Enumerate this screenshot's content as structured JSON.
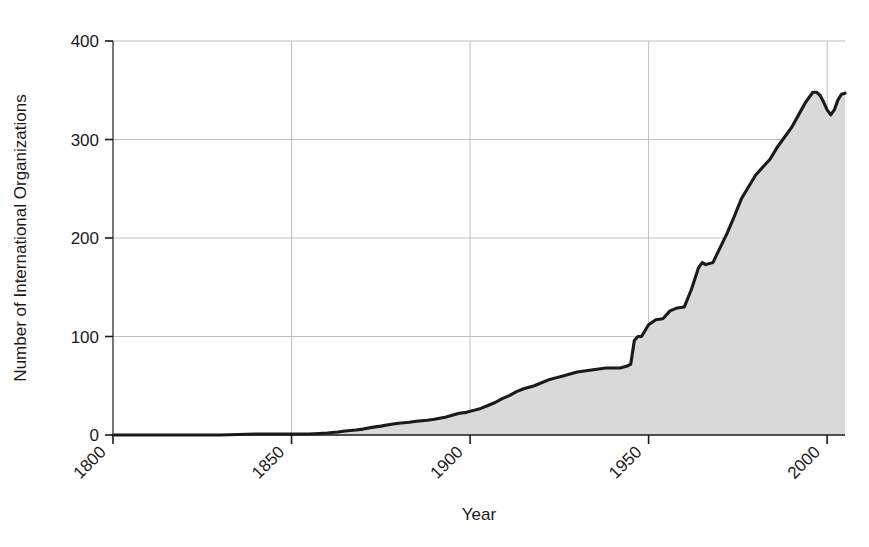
{
  "chart_data": {
    "type": "area",
    "title": "",
    "xlabel": "Year",
    "ylabel": "Number of International Organizations",
    "xlim": [
      1800,
      2005
    ],
    "ylim": [
      0,
      400
    ],
    "xticks": [
      1800,
      1850,
      1900,
      1950,
      2000
    ],
    "xtick_labels": [
      "1800",
      "1850",
      "1900",
      "1950",
      "2000"
    ],
    "yticks": [
      0,
      100,
      200,
      300,
      400
    ],
    "ytick_labels": [
      "0",
      "100",
      "200",
      "300",
      "400"
    ],
    "grid": true,
    "legend": "none",
    "line_color": "#1a1a1a",
    "fill_color": "#d9d9d9",
    "grid_color": "#b8b8b8",
    "axis_color": "#555555",
    "series": [
      {
        "name": "International Organizations",
        "x": [
          1800,
          1810,
          1820,
          1830,
          1840,
          1850,
          1855,
          1860,
          1863,
          1865,
          1868,
          1870,
          1873,
          1875,
          1878,
          1880,
          1883,
          1885,
          1888,
          1890,
          1893,
          1895,
          1897,
          1899,
          1901,
          1903,
          1905,
          1907,
          1909,
          1911,
          1913,
          1915,
          1918,
          1920,
          1922,
          1924,
          1926,
          1928,
          1930,
          1932,
          1934,
          1936,
          1938,
          1940,
          1942,
          1944,
          1945,
          1946,
          1947,
          1948,
          1950,
          1952,
          1954,
          1956,
          1958,
          1960,
          1962,
          1964,
          1965,
          1966,
          1968,
          1970,
          1972,
          1974,
          1976,
          1978,
          1980,
          1982,
          1984,
          1986,
          1988,
          1990,
          1992,
          1994,
          1996,
          1997,
          1998,
          1999,
          2000,
          2001,
          2002,
          2003,
          2004,
          2005
        ],
        "y": [
          0,
          0,
          0,
          0,
          1,
          1,
          1,
          2,
          3,
          4,
          5,
          6,
          8,
          9,
          11,
          12,
          13,
          14,
          15,
          16,
          18,
          20,
          22,
          23,
          25,
          27,
          30,
          33,
          37,
          40,
          44,
          47,
          50,
          53,
          56,
          58,
          60,
          62,
          64,
          65,
          66,
          67,
          68,
          68,
          68,
          70,
          72,
          96,
          100,
          100,
          112,
          117,
          118,
          126,
          129,
          130,
          148,
          170,
          175,
          173,
          175,
          190,
          205,
          222,
          240,
          252,
          264,
          272,
          280,
          292,
          302,
          312,
          325,
          338,
          348,
          348,
          345,
          338,
          330,
          325,
          330,
          340,
          346,
          347
        ]
      }
    ]
  },
  "axes": {
    "y_title": "Number of International Organizations",
    "x_title": "Year"
  }
}
